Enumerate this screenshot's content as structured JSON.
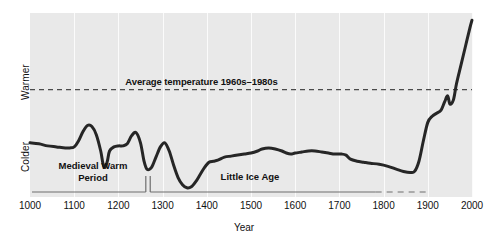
{
  "chart_data": {
    "type": "line",
    "title": "",
    "xlabel": "Year",
    "ylabel": "",
    "xlim": [
      1000,
      2000
    ],
    "ylim": [
      -1.05,
      0.75
    ],
    "grid": true,
    "legend_position": "none",
    "axis": {
      "x_ticks": [
        1000,
        1100,
        1200,
        1300,
        1400,
        1500,
        1600,
        1700,
        1800,
        1900,
        2000
      ],
      "x_tick_labels": [
        "1000",
        "1100",
        "1200",
        "1300",
        "1400",
        "1500",
        "1600",
        "1700",
        "1800",
        "1900",
        "2000"
      ],
      "y_tick_labels": [
        "Warmer",
        "Colder"
      ]
    },
    "series": [
      {
        "name": "Reconstructed temperature anomaly",
        "x": [
          1000,
          1020,
          1040,
          1060,
          1080,
          1090,
          1100,
          1110,
          1120,
          1130,
          1140,
          1150,
          1160,
          1165,
          1170,
          1175,
          1180,
          1190,
          1200,
          1210,
          1220,
          1230,
          1240,
          1250,
          1258,
          1265,
          1275,
          1285,
          1295,
          1305,
          1315,
          1325,
          1335,
          1345,
          1355,
          1365,
          1375,
          1385,
          1395,
          1405,
          1415,
          1425,
          1440,
          1455,
          1470,
          1485,
          1500,
          1515,
          1525,
          1540,
          1555,
          1570,
          1580,
          1590,
          1600,
          1615,
          1630,
          1645,
          1660,
          1675,
          1690,
          1705,
          1715,
          1725,
          1740,
          1755,
          1770,
          1790,
          1810,
          1830,
          1845,
          1860,
          1870,
          1880,
          1890,
          1900,
          1910,
          1920,
          1930,
          1938,
          1945,
          1950,
          1958,
          1965,
          1975,
          1985,
          1995,
          2000
        ],
        "y": [
          -0.52,
          -0.53,
          -0.55,
          -0.56,
          -0.57,
          -0.57,
          -0.56,
          -0.5,
          -0.41,
          -0.35,
          -0.36,
          -0.44,
          -0.6,
          -0.72,
          -0.76,
          -0.7,
          -0.6,
          -0.56,
          -0.55,
          -0.55,
          -0.53,
          -0.45,
          -0.42,
          -0.52,
          -0.7,
          -0.78,
          -0.76,
          -0.66,
          -0.56,
          -0.52,
          -0.6,
          -0.74,
          -0.86,
          -0.93,
          -0.96,
          -0.95,
          -0.9,
          -0.83,
          -0.76,
          -0.71,
          -0.7,
          -0.69,
          -0.66,
          -0.65,
          -0.64,
          -0.63,
          -0.62,
          -0.6,
          -0.58,
          -0.57,
          -0.58,
          -0.6,
          -0.62,
          -0.63,
          -0.62,
          -0.61,
          -0.6,
          -0.6,
          -0.61,
          -0.62,
          -0.63,
          -0.63,
          -0.64,
          -0.68,
          -0.7,
          -0.71,
          -0.72,
          -0.73,
          -0.75,
          -0.78,
          -0.8,
          -0.81,
          -0.8,
          -0.7,
          -0.5,
          -0.32,
          -0.26,
          -0.23,
          -0.2,
          -0.12,
          -0.06,
          -0.14,
          -0.1,
          0.06,
          0.24,
          0.42,
          0.6,
          0.68
        ],
        "line_color": "#262626",
        "line_width": 3
      }
    ],
    "reference_lines": [
      {
        "name": "average-temperature-line",
        "orientation": "horizontal",
        "value": 0.0,
        "label": "Average temperature 1960s–1980s",
        "style": "dashed",
        "color": "#4a4a4a"
      }
    ],
    "annotations": [
      {
        "name": "medieval-warm-period",
        "label": "Medieval Warm\nPeriod",
        "line1": "Medieval Warm",
        "line2": "Period",
        "x_start": 1000,
        "x_end": 1262,
        "bracket_style": "solid"
      },
      {
        "name": "little-ice-age",
        "label": "Little Ice Age",
        "line1": "Little Ice Age",
        "line2": "",
        "x_start": 1272,
        "x_end": 1900,
        "bracket_style": "solid-then-dashed",
        "dash_start": 1782
      }
    ],
    "colors": {
      "panel_background": "#e9e9e9",
      "gridline": "#fbfbfb",
      "curve": "#262626",
      "reference_line": "#4a4a4a",
      "bracket": "#6e6e6e",
      "text": "#111111"
    }
  }
}
